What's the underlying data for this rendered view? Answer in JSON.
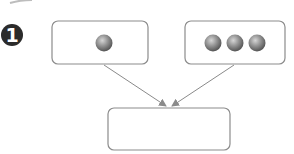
{
  "badge": {
    "label": "1"
  },
  "boxes": {
    "left": {
      "ball_count": 1
    },
    "right": {
      "ball_count": 3
    },
    "result": {
      "content": ""
    }
  },
  "colors": {
    "badge_fill": "#2b2b2b",
    "box_stroke": "#8c8c8c",
    "arrow": "#8a8a8a",
    "ball_light": "#c4c4c4",
    "ball_dark": "#5e5e5e"
  }
}
